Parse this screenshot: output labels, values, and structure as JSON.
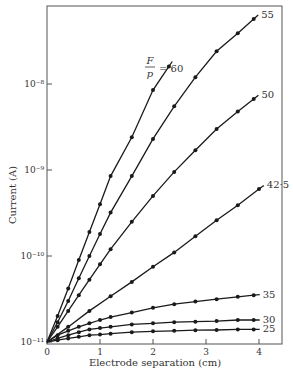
{
  "chart_data": {
    "type": "line",
    "title": "",
    "xlabel": "Electrode separation (cm)",
    "ylabel": "Current (A)",
    "xlim": [
      0,
      4.3
    ],
    "ylim": [
      1e-11,
      1e-07
    ],
    "yscale": "log",
    "grid": false,
    "legend": "inline labels at line ends",
    "x_ticks": [
      0,
      1,
      2,
      3,
      4
    ],
    "x_tick_labels": [
      "0",
      "1",
      "2",
      "3",
      "4"
    ],
    "y_ticks": [
      1e-11,
      1e-10,
      1e-09,
      1e-08
    ],
    "y_tick_labels": [
      "10⁻¹¹",
      "10⁻¹⁰",
      "10⁻⁹",
      "10⁻⁸"
    ],
    "annotation": "F/p = 60",
    "series": [
      {
        "name": "60",
        "label": "F/p = 60",
        "x": [
          0,
          0.2,
          0.4,
          0.6,
          0.8,
          1.0,
          1.2,
          1.6,
          2.0,
          2.3
        ],
        "y": [
          1e-11,
          2e-11,
          4.2e-11,
          9e-11,
          1.9e-10,
          4e-10,
          8.5e-10,
          2.4e-09,
          8.5e-09,
          1.6e-08
        ]
      },
      {
        "name": "55",
        "label": "55",
        "x": [
          0,
          0.2,
          0.4,
          0.6,
          0.8,
          1.0,
          1.2,
          1.6,
          2.0,
          2.4,
          2.8,
          3.2,
          3.6,
          3.9
        ],
        "y": [
          1e-11,
          1.7e-11,
          3e-11,
          5.5e-11,
          1e-10,
          1.8e-10,
          3.2e-10,
          8.5e-10,
          2.3e-09,
          5.5e-09,
          1.2e-08,
          2.4e-08,
          3.9e-08,
          5.7e-08
        ]
      },
      {
        "name": "50",
        "label": "50",
        "x": [
          0,
          0.2,
          0.4,
          0.6,
          0.8,
          1.0,
          1.2,
          1.6,
          2.0,
          2.4,
          2.8,
          3.2,
          3.6,
          3.9
        ],
        "y": [
          1e-11,
          1.5e-11,
          2.3e-11,
          3.5e-11,
          5.3e-11,
          8e-11,
          1.2e-10,
          2.5e-10,
          5e-10,
          9.5e-10,
          1.7e-09,
          3e-09,
          4.8e-09,
          6.7e-09
        ]
      },
      {
        "name": "42.5",
        "label": "42·5",
        "x": [
          0,
          0.4,
          0.8,
          1.2,
          1.6,
          2.0,
          2.4,
          2.8,
          3.2,
          3.6,
          4.0
        ],
        "y": [
          1e-11,
          1.5e-11,
          2.3e-11,
          3.4e-11,
          5e-11,
          7.5e-11,
          1.1e-10,
          1.7e-10,
          2.6e-10,
          3.9e-10,
          6e-10
        ]
      },
      {
        "name": "35",
        "label": "35",
        "x": [
          0,
          0.2,
          0.4,
          0.6,
          0.8,
          1.0,
          1.2,
          1.6,
          2.0,
          2.4,
          2.8,
          3.2,
          3.6,
          3.9
        ],
        "y": [
          1e-11,
          1.2e-11,
          1.35e-11,
          1.5e-11,
          1.65e-11,
          1.8e-11,
          1.95e-11,
          2.2e-11,
          2.5e-11,
          2.75e-11,
          2.95e-11,
          3.15e-11,
          3.35e-11,
          3.5e-11
        ]
      },
      {
        "name": "30",
        "label": "30",
        "x": [
          0,
          0.2,
          0.4,
          0.6,
          0.8,
          1.0,
          1.2,
          1.6,
          2.0,
          2.4,
          2.8,
          3.2,
          3.6,
          3.9
        ],
        "y": [
          1e-11,
          1.1e-11,
          1.2e-11,
          1.3e-11,
          1.4e-11,
          1.45e-11,
          1.5e-11,
          1.6e-11,
          1.65e-11,
          1.7e-11,
          1.72e-11,
          1.75e-11,
          1.8e-11,
          1.8e-11
        ]
      },
      {
        "name": "25",
        "label": "25",
        "x": [
          0,
          0.2,
          0.4,
          0.6,
          0.8,
          1.0,
          1.2,
          1.6,
          2.0,
          2.4,
          2.8,
          3.2,
          3.6,
          3.9
        ],
        "y": [
          1e-11,
          1.05e-11,
          1.1e-11,
          1.15e-11,
          1.2e-11,
          1.22e-11,
          1.25e-11,
          1.3e-11,
          1.33e-11,
          1.35e-11,
          1.37e-11,
          1.38e-11,
          1.4e-11,
          1.4e-11
        ]
      }
    ]
  },
  "layout": {
    "plot": {
      "left": 47,
      "right": 282,
      "top": 6,
      "bottom": 344
    },
    "line_color": "#1a1a1a",
    "frame_color": "#555555"
  }
}
